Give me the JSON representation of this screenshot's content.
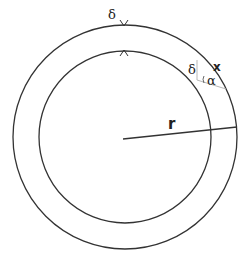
{
  "diagram": {
    "labels": {
      "delta_top": "δ",
      "delta_side": "δ",
      "x": "x",
      "alpha": "α",
      "r": "r"
    },
    "colors": {
      "stroke": "#333333",
      "construction": "#b8b8b8"
    }
  }
}
